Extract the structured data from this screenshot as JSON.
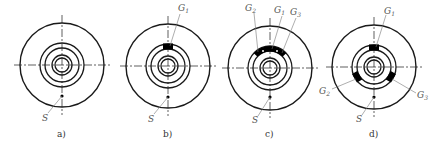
{
  "figure": {
    "colors": {
      "stroke": "#1a1a1a",
      "leader": "#777777",
      "fill": "#000000"
    },
    "panels": [
      {
        "id": "a",
        "caption": "a)",
        "center": [
          62,
          65
        ],
        "point_label": "S",
        "gates": []
      },
      {
        "id": "b",
        "caption": "b)",
        "center": [
          168,
          66
        ],
        "point_label": "S",
        "gates": [
          {
            "label": "G",
            "sub": "1"
          }
        ]
      },
      {
        "id": "c",
        "caption": "c)",
        "center": [
          270,
          68
        ],
        "point_label": "S",
        "gates": [
          {
            "label": "G",
            "sub": "2"
          },
          {
            "label": "G",
            "sub": "1"
          },
          {
            "label": "G",
            "sub": "3"
          }
        ]
      },
      {
        "id": "d",
        "caption": "d)",
        "center": [
          374,
          67
        ],
        "point_label": "S",
        "gates": [
          {
            "label": "G",
            "sub": "1"
          },
          {
            "label": "G",
            "sub": "2"
          },
          {
            "label": "G",
            "sub": "3"
          }
        ]
      }
    ]
  }
}
